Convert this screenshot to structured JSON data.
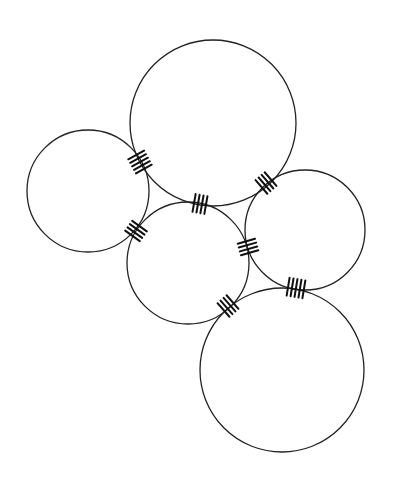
{
  "diagram": {
    "type": "circle-packing-with-contact-ticks",
    "stroke_color": "#222222",
    "background": "#ffffff",
    "circles": [
      {
        "id": "top-large",
        "cx": 213,
        "cy": 123,
        "r": 83
      },
      {
        "id": "left",
        "cx": 88,
        "cy": 191,
        "r": 61
      },
      {
        "id": "middle",
        "cx": 188,
        "cy": 263,
        "r": 61
      },
      {
        "id": "right",
        "cx": 305,
        "cy": 230,
        "r": 60
      },
      {
        "id": "bottom-large",
        "cx": 282,
        "cy": 370,
        "r": 82
      }
    ],
    "contacts": [
      {
        "between": [
          "top-large",
          "left"
        ],
        "x": 140,
        "y": 162,
        "ticks": 5
      },
      {
        "between": [
          "top-large",
          "middle"
        ],
        "x": 200,
        "y": 204,
        "ticks": 4
      },
      {
        "between": [
          "top-large",
          "right"
        ],
        "x": 266,
        "y": 183,
        "ticks": 4
      },
      {
        "between": [
          "left",
          "middle"
        ],
        "x": 136,
        "y": 231,
        "ticks": 4
      },
      {
        "between": [
          "middle",
          "right"
        ],
        "x": 248,
        "y": 247,
        "ticks": 4
      },
      {
        "between": [
          "middle",
          "bottom-large"
        ],
        "x": 228,
        "y": 306,
        "ticks": 4
      },
      {
        "between": [
          "right",
          "bottom-large"
        ],
        "x": 296,
        "y": 288,
        "ticks": 5
      }
    ]
  }
}
